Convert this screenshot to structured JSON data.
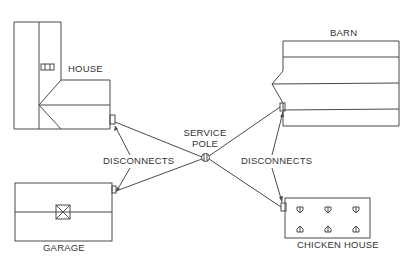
{
  "diagram": {
    "labels": {
      "house": "HOUSE",
      "barn": "BARN",
      "garage": "GARAGE",
      "chicken_house": "CHICKEN HOUSE",
      "service_pole_line1": "SERVICE",
      "service_pole_line2": "POLE",
      "disconnects_left": "DISCONNECTS",
      "disconnects_right": "DISCONNECTS"
    },
    "nodes": [
      {
        "id": "service-pole",
        "label": "SERVICE POLE"
      },
      {
        "id": "house",
        "label": "HOUSE",
        "has_disconnect": true
      },
      {
        "id": "barn",
        "label": "BARN",
        "has_disconnect": true
      },
      {
        "id": "garage",
        "label": "GARAGE",
        "has_disconnect": true
      },
      {
        "id": "chicken-house",
        "label": "CHICKEN HOUSE",
        "has_disconnect": true
      }
    ],
    "edges": [
      {
        "from": "service-pole",
        "to": "house"
      },
      {
        "from": "service-pole",
        "to": "barn"
      },
      {
        "from": "service-pole",
        "to": "garage"
      },
      {
        "from": "service-pole",
        "to": "chicken-house"
      }
    ],
    "colors": {
      "line": "#4a4a4a",
      "text": "#333333",
      "background": "#ffffff"
    }
  }
}
